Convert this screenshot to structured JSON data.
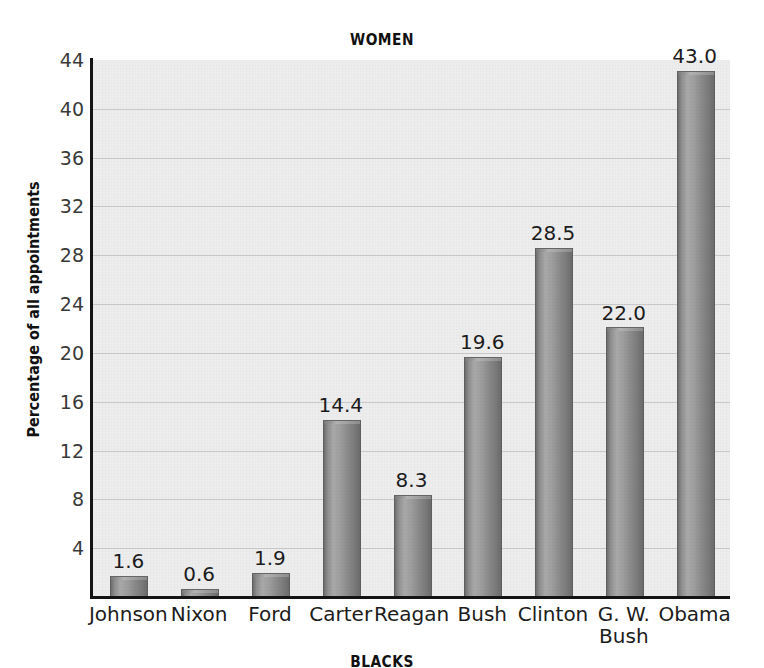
{
  "chart_data": {
    "type": "bar",
    "title": "WOMEN",
    "xlabel": "",
    "ylabel": "Percentage of all appointments",
    "categories": [
      "Johnson",
      "Nixon",
      "Ford",
      "Carter",
      "Reagan",
      "Bush",
      "Clinton",
      "G. W.\nBush",
      "Obama"
    ],
    "values": [
      1.6,
      0.6,
      1.9,
      14.4,
      8.3,
      19.6,
      28.5,
      22.0,
      43.0
    ],
    "value_labels": [
      "1.6",
      "0.6",
      "1.9",
      "14.4",
      "8.3",
      "19.6",
      "28.5",
      "22.0",
      "43.0"
    ],
    "ylim": [
      0,
      44
    ],
    "yticks": [
      4,
      8,
      12,
      16,
      20,
      24,
      28,
      32,
      36,
      40,
      44
    ],
    "ytick_labels": [
      "4",
      "8",
      "12",
      "16",
      "20",
      "24",
      "28",
      "32",
      "36",
      "40",
      "44"
    ],
    "grid": true,
    "grid_axis": "y",
    "legend": "none",
    "bar_color": "#9a9a9a",
    "plot_background": "#ededed",
    "gridline_color": "#c9c9c9",
    "axis_color": "#141414"
  },
  "bottom_caption": "BLACKS"
}
